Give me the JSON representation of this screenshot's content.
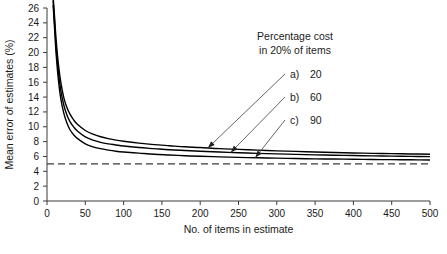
{
  "chart_data": {
    "type": "line",
    "title": "",
    "xlabel": "No. of items in estimate",
    "ylabel": "Mean error of estimates (%)",
    "xlim": [
      0,
      500
    ],
    "ylim": [
      0,
      26
    ],
    "xticks": [
      0,
      50,
      100,
      150,
      200,
      250,
      300,
      350,
      400,
      450,
      500
    ],
    "xtick_labels": [
      "0",
      "50",
      "100",
      "150",
      "200",
      "250",
      "300",
      "350",
      "400",
      "450",
      "500"
    ],
    "yticks": [
      0,
      2,
      4,
      6,
      8,
      10,
      12,
      14,
      16,
      18,
      20,
      22,
      24,
      26
    ],
    "ytick_labels": [
      "0",
      "2",
      "4",
      "6",
      "8",
      "10",
      "12",
      "14",
      "16",
      "18",
      "20",
      "22",
      "24",
      "26"
    ],
    "grid": false,
    "legend_position": "inside-upper-right",
    "legend_title_line1": "Percentage cost",
    "legend_title_line2": "in 20% of items",
    "series": [
      {
        "name": "a) 20",
        "label": "a)",
        "value": "20",
        "color": "#000000",
        "x": [
          8,
          10,
          12,
          15,
          18,
          22,
          26,
          30,
          35,
          40,
          50,
          60,
          70,
          80,
          90,
          100,
          120,
          140,
          160,
          180,
          200,
          225,
          250,
          275,
          300,
          325,
          350,
          375,
          400,
          425,
          450,
          475,
          500
        ],
        "y": [
          27.5,
          24.6,
          21.6,
          18.3,
          16.0,
          13.9,
          12.6,
          11.7,
          10.9,
          10.3,
          9.5,
          9.0,
          8.65,
          8.4,
          8.2,
          8.05,
          7.8,
          7.6,
          7.45,
          7.3,
          7.2,
          7.05,
          6.95,
          6.85,
          6.75,
          6.68,
          6.6,
          6.53,
          6.47,
          6.42,
          6.38,
          6.34,
          6.3
        ]
      },
      {
        "name": "b) 60",
        "label": "b)",
        "value": "60",
        "color": "#000000",
        "x": [
          8,
          10,
          12,
          15,
          18,
          22,
          26,
          30,
          35,
          40,
          50,
          60,
          70,
          80,
          90,
          100,
          120,
          140,
          160,
          180,
          200,
          225,
          250,
          275,
          300,
          325,
          350,
          375,
          400,
          425,
          450,
          475,
          500
        ],
        "y": [
          27.0,
          23.8,
          20.6,
          17.3,
          14.9,
          12.9,
          11.6,
          10.7,
          9.95,
          9.4,
          8.65,
          8.2,
          7.9,
          7.7,
          7.55,
          7.4,
          7.2,
          7.05,
          6.9,
          6.8,
          6.7,
          6.6,
          6.5,
          6.42,
          6.35,
          6.28,
          6.22,
          6.17,
          6.12,
          6.08,
          6.04,
          6.01,
          5.98
        ]
      },
      {
        "name": "c) 90",
        "label": "c)",
        "value": "90",
        "color": "#000000",
        "x": [
          8,
          10,
          12,
          15,
          18,
          22,
          26,
          30,
          35,
          40,
          50,
          60,
          70,
          80,
          90,
          100,
          120,
          140,
          160,
          180,
          200,
          225,
          250,
          275,
          300,
          325,
          350,
          375,
          400,
          425,
          450,
          475,
          500
        ],
        "y": [
          26.4,
          23.0,
          19.7,
          16.2,
          13.8,
          11.8,
          10.5,
          9.6,
          8.9,
          8.4,
          7.7,
          7.3,
          7.05,
          6.85,
          6.7,
          6.6,
          6.45,
          6.3,
          6.2,
          6.1,
          6.02,
          5.95,
          5.88,
          5.82,
          5.77,
          5.72,
          5.68,
          5.65,
          5.62,
          5.59,
          5.57,
          5.55,
          5.53
        ]
      }
    ],
    "reference_line": {
      "name": "asymptote",
      "orientation": "horizontal",
      "y": 5.0,
      "style": "dashed",
      "color": "#3a3a3a"
    },
    "annotations": [
      {
        "name": "arrow-a",
        "target_x": 210,
        "target_y": 7.15
      },
      {
        "name": "arrow-b",
        "target_x": 240,
        "target_y": 6.55
      },
      {
        "name": "arrow-c",
        "target_x": 272,
        "target_y": 5.85
      }
    ]
  }
}
